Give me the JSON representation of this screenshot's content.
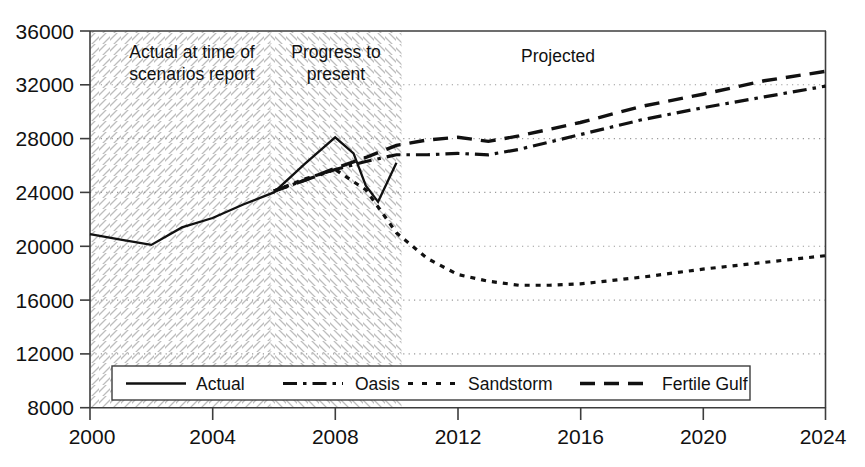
{
  "chart_data": {
    "type": "line",
    "title": "",
    "xlabel": "",
    "ylabel": "",
    "xlim": [
      2000,
      2024
    ],
    "ylim": [
      8000,
      36000
    ],
    "grid": true,
    "legend_position": "bottom-inside",
    "x_ticks": [
      2000,
      2004,
      2008,
      2012,
      2016,
      2020,
      2024
    ],
    "y_ticks": [
      8000,
      12000,
      16000,
      20000,
      24000,
      28000,
      32000,
      36000
    ],
    "x_tick_labels": [
      "2000",
      "2004",
      "2008",
      "2012",
      "2016",
      "2020",
      "2024"
    ],
    "y_tick_labels": [
      "8000",
      "12000",
      "16000",
      "20000",
      "24000",
      "28000",
      "32000",
      "36000"
    ],
    "annotations": [
      {
        "text": "Actual at time of scenarios report",
        "line1": "Actual at time of",
        "line2": "scenarios report",
        "x_range": [
          2000,
          2006
        ]
      },
      {
        "text": "Progress to present",
        "line1": "Progress to",
        "line2": "present",
        "x_range": [
          2006,
          2010
        ]
      },
      {
        "text": "Projected",
        "line1": "Projected",
        "line2": "",
        "x_range": [
          2010,
          2024
        ]
      }
    ],
    "shaded_regions": [
      {
        "label": "Actual at time of scenarios report",
        "x_start": 2000,
        "x_end": 2006,
        "hatch": "forward-diagonal"
      },
      {
        "label": "Progress to present",
        "x_start": 2006,
        "x_end": 2010,
        "hatch": "backward-diagonal"
      }
    ],
    "series": [
      {
        "name": "Actual",
        "style": "solid",
        "x": [
          2000,
          2001,
          2002,
          2003,
          2004,
          2005,
          2006,
          2007,
          2008,
          2008.6,
          2009,
          2009.4,
          2010
        ],
        "values": [
          20900,
          20500,
          20100,
          21400,
          22100,
          23100,
          24000,
          26100,
          28100,
          26900,
          24500,
          23300,
          26200
        ]
      },
      {
        "name": "Oasis",
        "style": "dash-dot",
        "x": [
          2006,
          2007,
          2008,
          2009,
          2010,
          2011,
          2012,
          2013,
          2014,
          2016,
          2018,
          2020,
          2022,
          2024
        ],
        "values": [
          24100,
          24900,
          25700,
          26300,
          26800,
          26800,
          26900,
          26800,
          27200,
          28300,
          29400,
          30300,
          31100,
          31900
        ]
      },
      {
        "name": "Sandstorm",
        "style": "dotted",
        "x": [
          2006,
          2007,
          2008,
          2009,
          2010,
          2011,
          2012,
          2013,
          2014,
          2015,
          2016,
          2018,
          2020,
          2022,
          2024
        ],
        "values": [
          24100,
          25000,
          25700,
          24200,
          21000,
          19100,
          17900,
          17400,
          17100,
          17100,
          17200,
          17700,
          18300,
          18800,
          19300
        ]
      },
      {
        "name": "Fertile Gulf",
        "style": "dashed",
        "x": [
          2006,
          2007,
          2008,
          2009,
          2010,
          2011,
          2012,
          2013,
          2014,
          2016,
          2018,
          2020,
          2022,
          2024
        ],
        "values": [
          24100,
          24900,
          25800,
          26600,
          27500,
          27900,
          28100,
          27800,
          28200,
          29200,
          30400,
          31300,
          32300,
          33000
        ]
      }
    ]
  },
  "legend": {
    "entries": [
      {
        "label": "Actual",
        "style": "solid"
      },
      {
        "label": "Oasis",
        "style": "dash-dot"
      },
      {
        "label": "Sandstorm",
        "style": "dotted"
      },
      {
        "label": "Fertile Gulf",
        "style": "dashed"
      }
    ]
  },
  "colors": {
    "line": "#111111",
    "axis": "#3d3d3d",
    "grid": "#9a9a9a",
    "hatch": "#b9b9b9",
    "background": "#ffffff"
  }
}
